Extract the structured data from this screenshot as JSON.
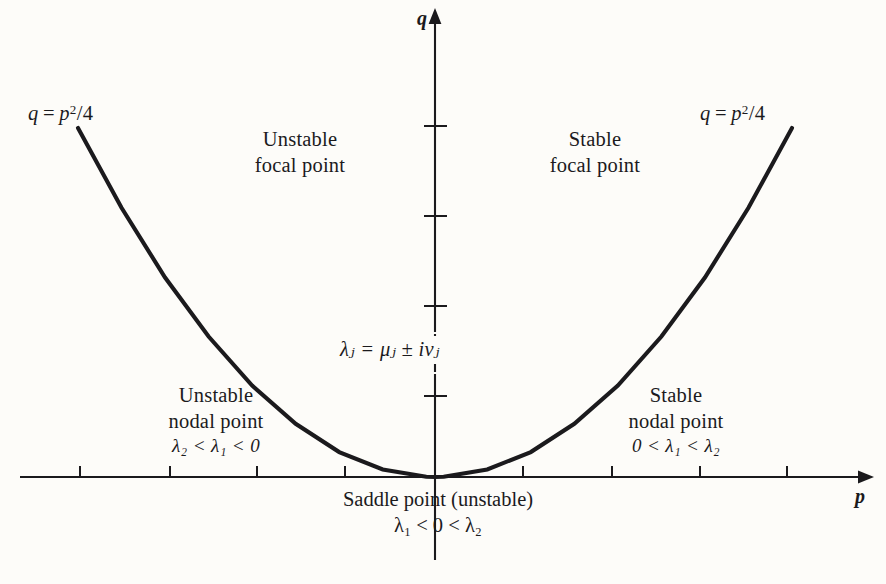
{
  "figure": {
    "background_color": "#fdfcf9",
    "ink_color": "#1b1a1d"
  },
  "axes": {
    "x_label": "p",
    "y_label": "q",
    "origin": {
      "x": 435,
      "y": 477
    },
    "x_ticks": [
      80,
      170,
      257,
      345,
      523,
      612,
      700,
      787
    ],
    "y_ticks": [
      126,
      216,
      306,
      396
    ]
  },
  "curve": {
    "equation_left": "q = p²/4",
    "equation_right": "q = p²/4",
    "name": "parabola-q-equals-p-squared-over-4"
  },
  "regions": {
    "unstable_focal": {
      "line1": "Unstable",
      "line2": "focal point"
    },
    "stable_focal": {
      "line1": "Stable",
      "line2": "focal point"
    },
    "unstable_nodal": {
      "line1": "Unstable",
      "line2": "nodal point",
      "line3": "λ₂ < λ₁ < 0"
    },
    "stable_nodal": {
      "line1": "Stable",
      "line2": "nodal point",
      "line3": "0 < λ₁ < λ₂"
    },
    "saddle": {
      "line1": "Saddle point (unstable)",
      "line2": "λ₁ < 0 < λ₂"
    }
  },
  "annotations": {
    "complex_eigenvalues": "λⱼ = μⱼ ± iνⱼ"
  },
  "chart_data": {
    "type": "line",
    "xlabel": "p",
    "ylabel": "q",
    "xlim": [
      -5.0,
      5.0
    ],
    "ylim": [
      -1.35,
      4.9
    ],
    "grid": false,
    "legend": null,
    "series": [
      {
        "name": "q = p^2/4",
        "equation": "q = p^2 / 4",
        "x": [
          -4.1,
          -3.6,
          -3.1,
          -2.6,
          -2.1,
          -1.6,
          -1.1,
          -0.6,
          -0.1,
          0,
          0.1,
          0.6,
          1.1,
          1.6,
          2.1,
          2.6,
          3.1,
          3.6,
          4.1
        ],
        "y": [
          4.2,
          3.24,
          2.4,
          1.69,
          1.1,
          0.64,
          0.3,
          0.09,
          0.0025,
          0,
          0.0025,
          0.09,
          0.3,
          0.64,
          1.1,
          1.69,
          2.4,
          3.24,
          4.2
        ]
      }
    ],
    "annotations": [
      {
        "text": "q = p²/4",
        "x": -4.3,
        "y": 4.55
      },
      {
        "text": "q = p²/4",
        "x": 3.85,
        "y": 4.55
      },
      {
        "text": "Unstable focal point",
        "x": -2.05,
        "y": 4.0
      },
      {
        "text": "Stable focal point",
        "x": 2.1,
        "y": 4.0
      },
      {
        "text": "Unstable nodal point  λ₂ < λ₁ < 0",
        "x": -2.7,
        "y": 0.95
      },
      {
        "text": "Stable nodal point  0 < λ₁ < λ₂",
        "x": 2.7,
        "y": 0.95
      },
      {
        "text": "λⱼ = μⱼ ± iνⱼ",
        "x": 0.0,
        "y": 1.6
      },
      {
        "text": "Saddle point (unstable)  λ₁ < 0 < λ₂",
        "x": 0.0,
        "y": -0.45
      }
    ]
  }
}
